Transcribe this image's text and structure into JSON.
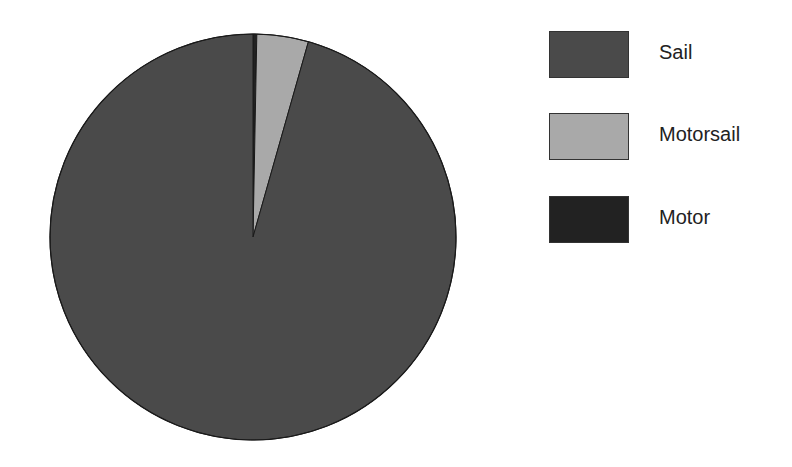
{
  "chart_data": {
    "type": "pie",
    "title": "",
    "categories": [
      "Sail",
      "Motorsail",
      "Motor"
    ],
    "values": [
      95.6,
      4.1,
      0.3
    ],
    "colors": [
      "#4a4a4a",
      "#a9a9a9",
      "#222222"
    ],
    "start_angle_deg": 0,
    "direction": "clockwise",
    "legend_position": "right"
  },
  "legend": {
    "items": [
      {
        "label": "Sail",
        "color": "#4a4a4a"
      },
      {
        "label": "Motorsail",
        "color": "#a9a9a9"
      },
      {
        "label": "Motor",
        "color": "#222222"
      }
    ]
  }
}
